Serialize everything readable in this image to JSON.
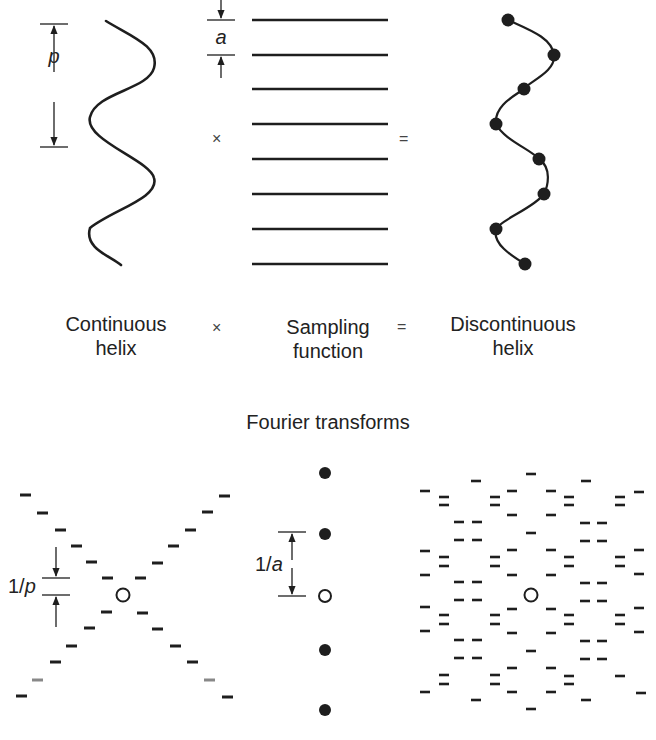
{
  "top_row": {
    "continuous_helix": {
      "dimension_label": "p",
      "caption_line1": "Continuous",
      "caption_line2": "helix"
    },
    "sampling_function": {
      "dimension_label": "a",
      "caption_line1": "Sampling",
      "caption_line2": "function",
      "line_count": 8
    },
    "discontinuous_helix": {
      "caption_line1": "Discontinuous",
      "caption_line2": "helix",
      "point_count": 8
    },
    "operators": {
      "multiply": "×",
      "equals": "="
    }
  },
  "section_title": "Fourier transforms",
  "bottom_row": {
    "helix_transform": {
      "dimension_label_prefix": "1/",
      "dimension_label_var": "p"
    },
    "sampling_transform": {
      "dimension_label_prefix": "1/",
      "dimension_label_var": "a"
    },
    "discontinuous_transform": {
      "origin_marker": "open-circle"
    }
  },
  "colors": {
    "ink": "#1e1e1e",
    "background": "#ffffff"
  }
}
